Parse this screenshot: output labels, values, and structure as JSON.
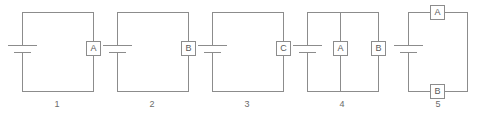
{
  "figure": {
    "line_color": "#8c8c8c",
    "text_color": "#6b6b6b",
    "background": "#ffffff"
  },
  "circuits": [
    {
      "number": "1",
      "meters": [
        {
          "label": "A",
          "position": "right-wire"
        }
      ],
      "battery": {
        "position": "left-wire"
      }
    },
    {
      "number": "2",
      "meters": [
        {
          "label": "B",
          "position": "right-wire"
        }
      ],
      "battery": {
        "position": "left-wire"
      }
    },
    {
      "number": "3",
      "meters": [
        {
          "label": "C",
          "position": "right-wire"
        }
      ],
      "battery": {
        "position": "left-wire"
      }
    },
    {
      "number": "4",
      "meters": [
        {
          "label": "A",
          "position": "middle-branch"
        },
        {
          "label": "B",
          "position": "right-wire"
        }
      ],
      "battery": {
        "position": "left-wire"
      }
    },
    {
      "number": "5",
      "meters": [
        {
          "label": "A",
          "position": "top-wire"
        },
        {
          "label": "B",
          "position": "bottom-wire"
        }
      ],
      "battery": {
        "position": "left-wire"
      }
    }
  ]
}
